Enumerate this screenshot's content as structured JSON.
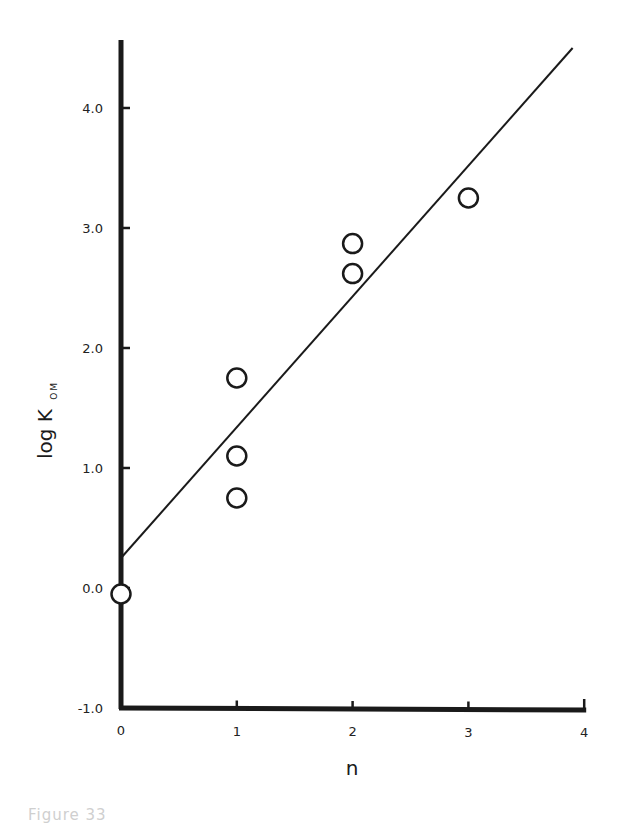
{
  "chart_data": {
    "type": "scatter",
    "title": "",
    "xlabel": "n",
    "ylabel": "log K",
    "ylabel_subscript": "OM",
    "xlim": [
      0,
      4
    ],
    "ylim": [
      -1.0,
      4.6
    ],
    "x_ticks": [
      0,
      1,
      2,
      3,
      4
    ],
    "x_tick_labels": [
      "0",
      "1",
      "2",
      "3",
      "4"
    ],
    "y_ticks": [
      -1.0,
      0.0,
      1.0,
      2.0,
      3.0,
      4.0
    ],
    "y_tick_labels": [
      "-1.0",
      "0.0",
      "1.0",
      "2.0",
      "3.0",
      "4.0"
    ],
    "grid": false,
    "legend": null,
    "series": [
      {
        "name": "observed",
        "marker": "open-circle",
        "points": [
          {
            "x": 0,
            "y": -0.05
          },
          {
            "x": 1,
            "y": 1.75
          },
          {
            "x": 1,
            "y": 1.1
          },
          {
            "x": 1,
            "y": 0.75
          },
          {
            "x": 2,
            "y": 2.87
          },
          {
            "x": 2,
            "y": 2.62
          },
          {
            "x": 3,
            "y": 3.25
          }
        ]
      },
      {
        "name": "fit",
        "type": "line",
        "points": [
          {
            "x": 0,
            "y": 0.25
          },
          {
            "x": 3.9,
            "y": 4.5
          }
        ]
      }
    ]
  },
  "caption": "Figure 33"
}
